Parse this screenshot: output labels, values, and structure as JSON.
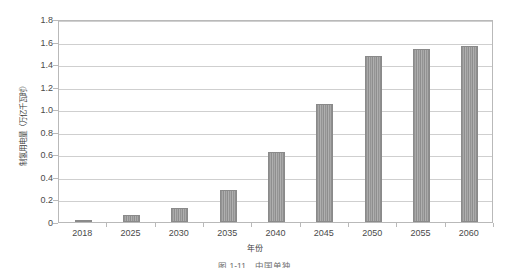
{
  "chart_data": {
    "type": "bar",
    "title": "",
    "xlabel": "年份",
    "ylabel": "制氢用电量（万亿千瓦时）",
    "categories": [
      "2018",
      "2025",
      "2030",
      "2035",
      "2040",
      "2045",
      "2050",
      "2055",
      "2060"
    ],
    "values": [
      0.02,
      0.06,
      0.12,
      0.28,
      0.62,
      1.05,
      1.47,
      1.53,
      1.56
    ],
    "series": [
      {
        "name": "制氢用电量",
        "values": [
          0.02,
          0.06,
          0.12,
          0.28,
          0.62,
          1.05,
          1.47,
          1.53,
          1.56
        ]
      }
    ],
    "ylim": [
      0,
      1.8
    ],
    "ytick_values": [
      0,
      0.2,
      0.4,
      0.6,
      0.8,
      1.0,
      1.2,
      1.4,
      1.6,
      1.8
    ],
    "ytick_labels": [
      "0",
      "0.2",
      "0.4",
      "0.6",
      "0.8",
      "1.0",
      "1.2",
      "1.4",
      "1.6",
      "1.8"
    ],
    "grid": "horizontal",
    "legend": "none",
    "bar_color": "#9a9a9a",
    "bar_pattern": "vertical-stripes",
    "gridline_color": "#cfcfcf",
    "frame_color": "#b9b9b9",
    "text_color": "#4a4a4a"
  },
  "caption": {
    "text": "图 1-11　中国单独",
    "clipped": true
  }
}
